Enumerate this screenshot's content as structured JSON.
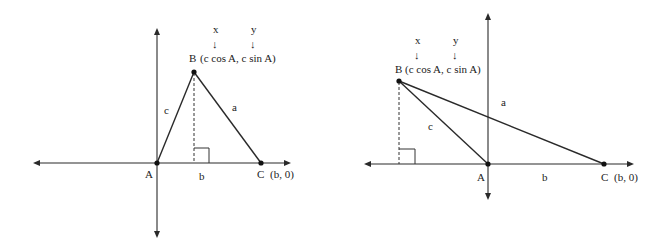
{
  "figures": [
    {
      "id": "acute",
      "labels": {
        "vertex_A": "A",
        "vertex_B": "B",
        "vertex_B_coords": "(c cos A, c sin A)",
        "vertex_C": "C",
        "vertex_C_coords": "(b, 0)",
        "side_a": "a",
        "side_b": "b",
        "side_c": "c",
        "x_marker": "x",
        "y_marker": "y",
        "down_arrow": "↓"
      }
    },
    {
      "id": "obtuse",
      "labels": {
        "vertex_A": "A",
        "vertex_B": "B",
        "vertex_B_coords": "(c cos A, c sin A)",
        "vertex_C": "C",
        "vertex_C_coords": "(b, 0)",
        "side_a": "a",
        "side_b": "b",
        "side_c": "c",
        "x_marker": "x",
        "y_marker": "y",
        "down_arrow": "↓"
      }
    }
  ],
  "colors": {
    "line": "#2a2a2a",
    "background": "#ffffff"
  }
}
